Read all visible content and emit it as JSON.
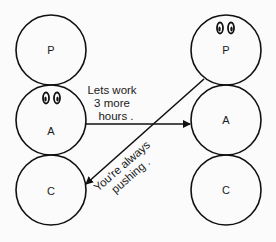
{
  "diagram": {
    "type": "transactional-analysis-crossed-transaction",
    "left_person": {
      "states": [
        {
          "label": "P",
          "active": false
        },
        {
          "label": "A",
          "active": true
        },
        {
          "label": "C",
          "active": false
        }
      ]
    },
    "right_person": {
      "states": [
        {
          "label": "P",
          "active": true
        },
        {
          "label": "A",
          "active": false
        },
        {
          "label": "C",
          "active": false
        }
      ]
    },
    "transactions": [
      {
        "from": "left.A",
        "to": "right.A",
        "lines": [
          "Lets work",
          "3 more",
          "hours ."
        ]
      },
      {
        "from": "right.P",
        "to": "left.C",
        "lines": [
          "You're always",
          "pushing ."
        ]
      }
    ],
    "colors": {
      "stroke": "#111111",
      "background": "#fbfbfb"
    }
  }
}
